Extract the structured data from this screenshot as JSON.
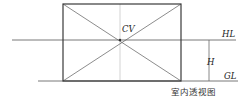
{
  "diagram": {
    "title": "室内透视图",
    "labels": {
      "center_of_vision": "CV",
      "horizon_line": "HL",
      "height": "H",
      "ground_line": "GL"
    },
    "colors": {
      "frame": "#3a3a3a",
      "diagonal": "#5a5a5a",
      "guide": "#9a9a9a",
      "text": "#222222"
    },
    "geometry": {
      "frame": {
        "x1": 63,
        "y1": 4,
        "x2": 181,
        "y2": 81
      },
      "center_point": {
        "x": 120,
        "y": 40
      },
      "horizon_line": {
        "x1": 12,
        "x2": 236,
        "y": 40
      },
      "ground_line": {
        "x1": 38,
        "x2": 238,
        "y": 81
      },
      "height_marker": {
        "x": 209,
        "y1": 40,
        "y2": 81
      }
    }
  }
}
